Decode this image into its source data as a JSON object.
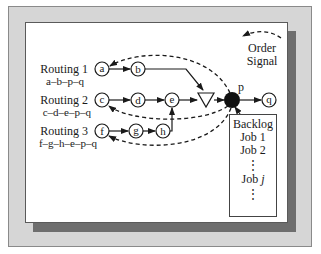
{
  "diagram": {
    "routings": [
      {
        "label": "Routing 1",
        "sequence": "a–b–p–q"
      },
      {
        "label": "Routing 2",
        "sequence": "c–d–e–p–q"
      },
      {
        "label": "Routing 3",
        "sequence": "f–g–h–e–p–q"
      }
    ],
    "nodes": {
      "a": "a",
      "b": "b",
      "c": "c",
      "d": "d",
      "e": "e",
      "f": "f",
      "g": "g",
      "h": "h",
      "p": "p",
      "q": "q"
    },
    "order_signal": {
      "line1": "Order",
      "line2": "Signal"
    },
    "backlog": {
      "title": "Backlog",
      "items": [
        "Job 1",
        "Job 2",
        "⋮",
        "Job j",
        "⋮"
      ]
    },
    "colors": {
      "outer_frame": "#d6d6d6",
      "shadow": "#6e6e6e",
      "panel": "#ffffff",
      "stroke": "#1a1a1a"
    }
  }
}
